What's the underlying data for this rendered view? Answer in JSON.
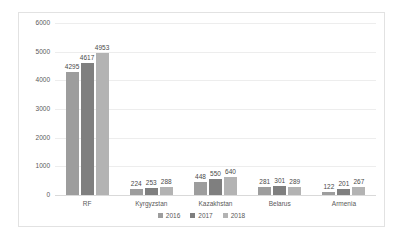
{
  "chart_data": {
    "type": "bar",
    "title": "",
    "xlabel": "",
    "ylabel": "",
    "ylim": [
      0,
      6000
    ],
    "yticks": [
      6000,
      5000,
      4000,
      3000,
      2000,
      1000,
      0
    ],
    "grid": true,
    "legend_position": "bottom",
    "categories": [
      "RF",
      "Kyrgyzstan",
      "Kazakhstan",
      "Belarus",
      "Armenia"
    ],
    "series": [
      {
        "name": "2016",
        "color": "#9d9d9d",
        "values": [
          4295,
          224,
          448,
          281,
          122
        ]
      },
      {
        "name": "2017",
        "color": "#7f7f7f",
        "values": [
          4617,
          253,
          550,
          301,
          201
        ]
      },
      {
        "name": "2018",
        "color": "#b3b3b3",
        "values": [
          4953,
          288,
          640,
          289,
          267
        ]
      }
    ]
  },
  "style": {
    "plot_border_color": "#e2e2e2",
    "gridline_color": "#ededed",
    "axis_color": "#d9d9d9",
    "label_color": "#595959",
    "background": "#ffffff"
  }
}
